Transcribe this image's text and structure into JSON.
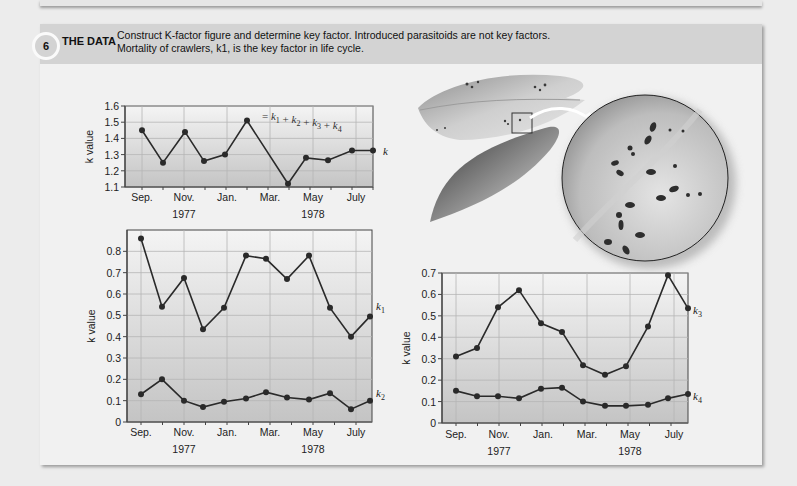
{
  "header": {
    "step_number": "6",
    "title": "THE DATA",
    "line1": "Construct K-factor figure and determine key factor. Introduced parasitoids are not key factors.",
    "line2": "Mortality of crawlers, k1, is the key factor in life cycle."
  },
  "colors": {
    "background": "#ececec",
    "card": "#f1f1f1",
    "header_band": "#d3d3d3",
    "line": "#2a2a2a",
    "grid": "#b5b5b5"
  },
  "illustration": {
    "description": "Leaves with scale insects; magnified circular inset of crawlers",
    "icon": "leaf-magnifier-illustration"
  },
  "chart_data": [
    {
      "type": "line",
      "title": "",
      "xlabel": "",
      "ylabel": "k value",
      "ylim": [
        1.1,
        1.6
      ],
      "yticks": [
        "1.1",
        "1.2",
        "1.3",
        "1.4",
        "1.5",
        "1.6"
      ],
      "x_tick_labels": [
        "Sep.",
        "Nov.",
        "Jan.",
        "Mar.",
        "May",
        "July"
      ],
      "year_labels": [
        "1977",
        "1978"
      ],
      "grid": true,
      "annotation": "= k1 + k2 + k3 + k4",
      "x": [
        "Sep",
        "Oct",
        "Nov",
        "Dec",
        "Jan",
        "Feb",
        "Mar",
        "Apr",
        "May",
        "Jun",
        "Jul"
      ],
      "series": [
        {
          "name": "k",
          "values": [
            1.45,
            1.25,
            1.44,
            1.26,
            1.3,
            1.51,
            1.12,
            1.28,
            1.265,
            1.325,
            1.325
          ]
        }
      ]
    },
    {
      "type": "line",
      "title": "",
      "xlabel": "",
      "ylabel": "k value",
      "ylim": [
        0,
        0.9
      ],
      "yticks": [
        "0",
        "0.1",
        "0.2",
        "0.3",
        "0.4",
        "0.5",
        "0.6",
        "0.7",
        "0.8"
      ],
      "x_tick_labels": [
        "Sep.",
        "Nov.",
        "Jan.",
        "Mar.",
        "May",
        "July"
      ],
      "year_labels": [
        "1977",
        "1978"
      ],
      "grid": true,
      "x": [
        "Sep",
        "Oct",
        "Nov",
        "Dec",
        "Jan",
        "Feb",
        "Mar",
        "Apr",
        "May",
        "Jun",
        "Jul",
        "Jul2"
      ],
      "series": [
        {
          "name": "k1",
          "values": [
            0.86,
            0.54,
            0.675,
            0.435,
            0.535,
            0.78,
            0.765,
            0.67,
            0.78,
            0.535,
            0.4,
            0.495
          ]
        },
        {
          "name": "k2",
          "values": [
            0.13,
            0.2,
            0.1,
            0.07,
            0.095,
            0.11,
            0.14,
            0.115,
            0.105,
            0.135,
            0.06,
            0.1
          ]
        }
      ]
    },
    {
      "type": "line",
      "title": "",
      "xlabel": "",
      "ylabel": "k value",
      "ylim": [
        0,
        0.7
      ],
      "yticks": [
        "0",
        "0.1",
        "0.2",
        "0.3",
        "0.4",
        "0.5",
        "0.6",
        "0.7"
      ],
      "x_tick_labels": [
        "Sep.",
        "Nov.",
        "Jan.",
        "Mar.",
        "May",
        "July"
      ],
      "year_labels": [
        "1977",
        "1978"
      ],
      "grid": true,
      "x": [
        "Sep",
        "Oct",
        "Nov",
        "Dec",
        "Jan",
        "Feb",
        "Mar",
        "Apr",
        "May",
        "Jun",
        "Jul",
        "Jul2"
      ],
      "series": [
        {
          "name": "k3",
          "values": [
            0.31,
            0.35,
            0.54,
            0.62,
            0.465,
            0.425,
            0.27,
            0.225,
            0.265,
            0.45,
            0.69,
            0.535
          ]
        },
        {
          "name": "k4",
          "values": [
            0.15,
            0.125,
            0.125,
            0.115,
            0.16,
            0.165,
            0.1,
            0.08,
            0.08,
            0.085,
            0.115,
            0.135
          ]
        }
      ]
    }
  ]
}
